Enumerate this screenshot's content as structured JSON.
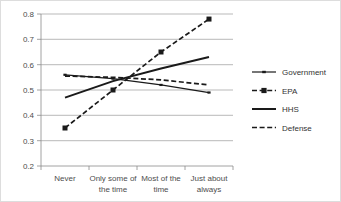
{
  "chart_data": {
    "type": "line",
    "title": "",
    "xlabel": "",
    "ylabel": "",
    "categories": [
      "Never",
      "Only some of the time",
      "Most of the time",
      "Just about always"
    ],
    "ylim": [
      0.2,
      0.8
    ],
    "yticks": [
      "0.2",
      "0.3",
      "0.4",
      "0.5",
      "0.6",
      "0.7",
      "0.8"
    ],
    "ytick_values": [
      0.2,
      0.3,
      0.4,
      0.5,
      0.6,
      0.7,
      0.8
    ],
    "grid": true,
    "legend_position": "right",
    "series": [
      {
        "name": "Government",
        "values": [
          0.56,
          0.545,
          0.52,
          0.49
        ],
        "style": "solid-thin",
        "marker": "small-dash",
        "color": "#1a1a1a"
      },
      {
        "name": "EPA",
        "values": [
          0.35,
          0.5,
          0.65,
          0.78
        ],
        "style": "dashed",
        "marker": "square",
        "color": "#1a1a1a"
      },
      {
        "name": "HHS",
        "values": [
          0.47,
          0.535,
          0.585,
          0.63
        ],
        "style": "solid-thick",
        "marker": "none",
        "color": "#1a1a1a"
      },
      {
        "name": "Defense",
        "values": [
          0.555,
          0.55,
          0.54,
          0.52
        ],
        "style": "dashed",
        "marker": "none",
        "color": "#1a1a1a"
      }
    ]
  },
  "axis": {
    "y_labels": [
      "0.8",
      "0.7",
      "0.6",
      "0.5",
      "0.4",
      "0.3",
      "0.2"
    ],
    "x_labels": [
      {
        "line1": "Never",
        "line2": ""
      },
      {
        "line1": "Only some of",
        "line2": "the time"
      },
      {
        "line1": "Most of the",
        "line2": "time"
      },
      {
        "line1": "Just about",
        "line2": "always"
      }
    ]
  },
  "legend": {
    "items": [
      {
        "label": "Government"
      },
      {
        "label": "EPA"
      },
      {
        "label": "HHS"
      },
      {
        "label": "Defense"
      }
    ]
  }
}
